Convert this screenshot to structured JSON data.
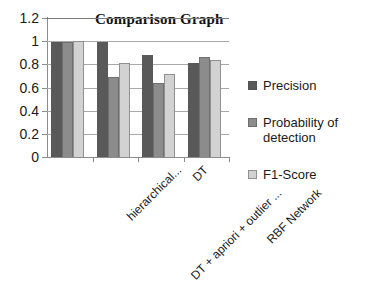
{
  "chart_data": {
    "type": "bar",
    "title": "Comparison Graph",
    "xlabel": "",
    "ylabel": "",
    "ylim": [
      0,
      1.2
    ],
    "yticks": [
      "0",
      "0.2",
      "0.4",
      "0.6",
      "0.8",
      "1",
      "1.2"
    ],
    "grid": true,
    "legend_position": "right",
    "categories": [
      "hierarchical...",
      "DT + apriori + outlier ...",
      "DT",
      "RBF Network"
    ],
    "series": [
      {
        "name": "Precision",
        "color": "#595959",
        "values": [
          0.99,
          0.99,
          0.88,
          0.81
        ]
      },
      {
        "name": "Probability of detection",
        "color": "#8c8c8c",
        "values": [
          0.99,
          0.69,
          0.64,
          0.86
        ]
      },
      {
        "name": "F1-Score",
        "color": "#d2d2d2",
        "values": [
          1.0,
          0.81,
          0.72,
          0.84
        ]
      }
    ]
  },
  "legend": {
    "items": [
      {
        "label": "Precision"
      },
      {
        "label": "Probability of detection"
      },
      {
        "label": "F1-Score"
      }
    ]
  }
}
